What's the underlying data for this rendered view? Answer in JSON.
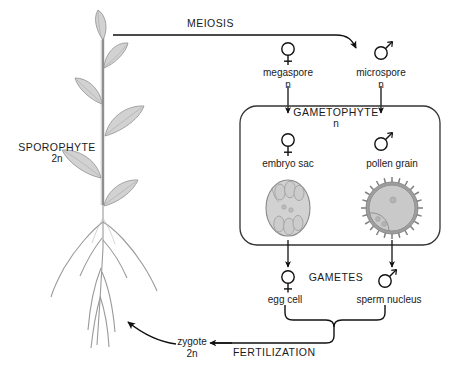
{
  "diagram": {
    "type": "biology-life-cycle-diagram",
    "background_color": "#ffffff",
    "ink_color": "#1a1a1a",
    "fill_color": "#d2d2d2",
    "outline_color": "#8a8a8a"
  },
  "labels": {
    "meiosis": "MEIOSIS",
    "sporophyte": "SPOROPHYTE",
    "sporophyte_ploidy": "2n",
    "megaspore": "megaspore",
    "megaspore_ploidy": "n",
    "microspore": "microspore",
    "microspore_ploidy": "n",
    "gametophyte": "GAMETOPHYTE",
    "gametophyte_ploidy": "n",
    "embryo_sac": "embryo sac",
    "pollen_grain": "pollen grain",
    "gametes": "GAMETES",
    "egg_cell": "egg cell",
    "sperm_nucleus": "sperm nucleus",
    "fertilization": "FERTILIZATION",
    "zygote": "zygote",
    "zygote_ploidy": "2n"
  },
  "symbols": {
    "female": "venus-symbol",
    "male": "mars-symbol"
  },
  "stages": [
    {
      "name": "sporophyte",
      "ploidy": "2n",
      "structure": "whole plant with leaves, stem and roots"
    },
    {
      "name": "megaspore",
      "ploidy": "n",
      "sex": "female"
    },
    {
      "name": "microspore",
      "ploidy": "n",
      "sex": "male"
    },
    {
      "name": "embryo sac",
      "ploidy": "n",
      "sex": "female"
    },
    {
      "name": "pollen grain",
      "ploidy": "n",
      "sex": "male"
    },
    {
      "name": "egg cell",
      "ploidy": "n",
      "sex": "female"
    },
    {
      "name": "sperm nucleus",
      "ploidy": "n",
      "sex": "male"
    },
    {
      "name": "zygote",
      "ploidy": "2n"
    }
  ],
  "processes": [
    {
      "name": "MEIOSIS",
      "from": "sporophyte",
      "to": "spores"
    },
    {
      "name": "FERTILIZATION",
      "from": "gametes",
      "to": "zygote"
    }
  ]
}
